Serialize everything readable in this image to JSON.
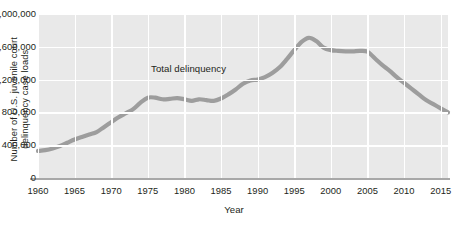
{
  "figure": {
    "background": "#ffffff",
    "plot_background": "#e9e9e9",
    "gridline_color": "#ffffff",
    "axis_color": "#a8a8a8",
    "line_color": "#9d9d9d"
  },
  "axes": {
    "ylabel": "Number of U.S. juvenile court\ndelinquency case loads",
    "xlabel": "Year",
    "ytick_labels": [
      "2,000,000",
      "1,600,000",
      "1,200,000",
      "800,000",
      "400,000",
      "0"
    ],
    "xtick_labels": [
      "1960",
      "1965",
      "1970",
      "1975",
      "1980",
      "1985",
      "1990",
      "1995",
      "2000",
      "2005",
      "2010",
      "2015"
    ]
  },
  "annotation": {
    "text": "Total delinquency"
  },
  "chart_data": {
    "type": "line",
    "title": "",
    "xlabel": "Year",
    "ylabel": "Number of U.S. juvenile court delinquency case loads",
    "xlim": [
      1960,
      2016
    ],
    "ylim": [
      0,
      2000000
    ],
    "ytick_values": [
      0,
      400000,
      800000,
      1200000,
      1600000,
      2000000
    ],
    "xtick_values": [
      1960,
      1965,
      1970,
      1975,
      1980,
      1985,
      1990,
      1995,
      2000,
      2005,
      2010,
      2015
    ],
    "grid": true,
    "legend": "none",
    "annotations": [
      {
        "text": "Total delinquency",
        "x": 1982,
        "y": 1330000
      }
    ],
    "series": [
      {
        "name": "Total delinquency",
        "color": "#9d9d9d",
        "x": [
          1960,
          1961,
          1962,
          1963,
          1964,
          1965,
          1966,
          1967,
          1968,
          1969,
          1970,
          1971,
          1972,
          1973,
          1974,
          1975,
          1976,
          1977,
          1978,
          1979,
          1980,
          1981,
          1982,
          1983,
          1984,
          1985,
          1986,
          1987,
          1988,
          1989,
          1990,
          1991,
          1992,
          1993,
          1994,
          1995,
          1996,
          1997,
          1998,
          1999,
          2000,
          2001,
          2002,
          2003,
          2004,
          2005,
          2006,
          2007,
          2008,
          2009,
          2010,
          2011,
          2012,
          2013,
          2014,
          2015,
          2016
        ],
        "y": [
          330000,
          340000,
          360000,
          390000,
          430000,
          470000,
          500000,
          530000,
          560000,
          620000,
          680000,
          740000,
          790000,
          840000,
          920000,
          980000,
          980000,
          960000,
          965000,
          975000,
          960000,
          940000,
          960000,
          950000,
          940000,
          970000,
          1020000,
          1080000,
          1150000,
          1190000,
          1200000,
          1230000,
          1280000,
          1350000,
          1450000,
          1560000,
          1660000,
          1710000,
          1670000,
          1590000,
          1560000,
          1550000,
          1545000,
          1545000,
          1550000,
          1540000,
          1460000,
          1380000,
          1310000,
          1230000,
          1160000,
          1090000,
          1020000,
          950000,
          900000,
          850000,
          800000
        ]
      }
    ]
  }
}
